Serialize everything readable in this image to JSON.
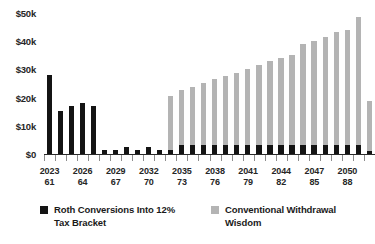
{
  "chart_data": {
    "type": "bar",
    "title": "",
    "subtitle": "",
    "xlabel": "",
    "ylabel": "",
    "ylim": [
      0,
      50000
    ],
    "grid": false,
    "legend_position": "bottom",
    "y_ticks": [
      0,
      10000,
      20000,
      30000,
      40000,
      50000
    ],
    "y_tick_labels": [
      "$0",
      "$10k",
      "$20k",
      "$30k",
      "$40k",
      "$50k"
    ],
    "categories": [
      "2023",
      "2024",
      "2025",
      "2026",
      "2027",
      "2028",
      "2029",
      "2030",
      "2031",
      "2032",
      "2033",
      "2034",
      "2035",
      "2036",
      "2037",
      "2038",
      "2039",
      "2040",
      "2041",
      "2042",
      "2043",
      "2044",
      "2045",
      "2046",
      "2047",
      "2048",
      "2049",
      "2050",
      "2051",
      "2052"
    ],
    "secondary_categories": [
      "61",
      "62",
      "63",
      "64",
      "65",
      "66",
      "67",
      "68",
      "69",
      "70",
      "71",
      "72",
      "73",
      "74",
      "75",
      "76",
      "77",
      "78",
      "79",
      "80",
      "81",
      "82",
      "83",
      "84",
      "85",
      "86",
      "87",
      "88",
      "89",
      "90"
    ],
    "x_tick_label_every": 3,
    "x_tick_labels_shown": [
      {
        "year": "2023",
        "age": "61",
        "index": 0
      },
      {
        "year": "2026",
        "age": "64",
        "index": 3
      },
      {
        "year": "2029",
        "age": "67",
        "index": 6
      },
      {
        "year": "2032",
        "age": "70",
        "index": 9
      },
      {
        "year": "2035",
        "age": "73",
        "index": 12
      },
      {
        "year": "2038",
        "age": "76",
        "index": 15
      },
      {
        "year": "2041",
        "age": "79",
        "index": 18
      },
      {
        "year": "2044",
        "age": "82",
        "index": 21
      },
      {
        "year": "2047",
        "age": "85",
        "index": 24
      },
      {
        "year": "2050",
        "age": "88",
        "index": 27
      }
    ],
    "series": [
      {
        "name": "Conventional Withdrawal Wisdom",
        "color": "#b4b4b4",
        "values": [
          1200,
          700,
          400,
          1300,
          1200,
          1300,
          1200,
          1100,
          1300,
          1100,
          1300,
          21000,
          23000,
          24000,
          25500,
          27000,
          28000,
          29000,
          30500,
          32000,
          33500,
          34500,
          35500,
          39500,
          40500,
          42000,
          43500,
          44500,
          49000,
          19000
        ]
      },
      {
        "name": "Roth Conversions Into 12% Tax Bracket",
        "color": "#141414",
        "values": [
          28500,
          15500,
          17500,
          18500,
          17500,
          1800,
          1900,
          2800,
          1900,
          2800,
          1900,
          1900,
          3600,
          3600,
          3600,
          3600,
          3600,
          3600,
          3600,
          3600,
          3600,
          3600,
          3600,
          3600,
          3600,
          3600,
          3600,
          3600,
          3600,
          1600
        ]
      }
    ]
  },
  "legend": {
    "items": [
      {
        "label": "Roth Conversions Into 12% Tax Bracket",
        "color": "#141414",
        "swatch": "black-square-icon"
      },
      {
        "label": "Conventional Withdrawal Wisdom",
        "color": "#b4b4b4",
        "swatch": "gray-square-icon"
      }
    ]
  },
  "colors": {
    "background": "#ffffff",
    "black_series": "#141414",
    "gray_series": "#b4b4b4",
    "axis": "#2b2b2b",
    "tick": "#8d8d8d",
    "text": "#1a1a1a"
  }
}
